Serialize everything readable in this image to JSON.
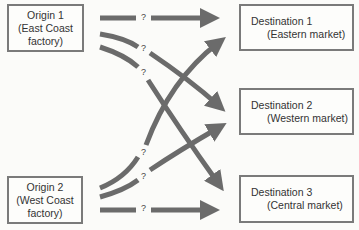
{
  "origins": [
    {
      "title": "Origin 1",
      "line2": "(East Coast",
      "line3": "factory)"
    },
    {
      "title": "Origin 2",
      "line2": "(West Coast",
      "line3": "factory)"
    }
  ],
  "destinations": [
    {
      "title": "Destination 1",
      "sub": "(Eastern market)"
    },
    {
      "title": "Destination 2",
      "sub": "(Western market)"
    },
    {
      "title": "Destination 3",
      "sub": "(Central market)"
    }
  ],
  "route_label": "?",
  "colors": {
    "arrow": "#6b6b6b",
    "border": "#7a7a7a"
  }
}
